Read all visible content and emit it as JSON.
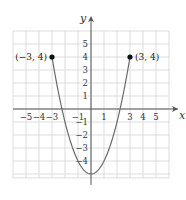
{
  "chart_data": {
    "type": "line",
    "title": "",
    "xlabel": "x",
    "ylabel": "y",
    "xlim": [
      -6,
      6
    ],
    "ylim": [
      -5.4,
      6
    ],
    "grid": true,
    "x_ticks": [
      "-5",
      "-4",
      "-3",
      "-1",
      "1",
      "3",
      "4",
      "5"
    ],
    "x_tick_values": [
      -5,
      -4,
      -3,
      -1,
      1,
      3,
      4,
      5
    ],
    "y_ticks": [
      "5",
      "4",
      "3",
      "2",
      "1",
      "-1",
      "-2",
      "-3",
      "-4"
    ],
    "y_tick_values": [
      5,
      4,
      3,
      2,
      1,
      -1,
      -2,
      -3,
      -4
    ],
    "series": [
      {
        "name": "y = x^2 - 5",
        "domain": [
          -3,
          3
        ],
        "x": [
          -3,
          -2,
          -1,
          0,
          1,
          2,
          3
        ],
        "y": [
          4,
          -1,
          -4,
          -5,
          -4,
          -1,
          4
        ]
      }
    ],
    "annotations": [
      {
        "label": "(−3, 4)",
        "x": -3,
        "y": 4,
        "marker": "filled-dot"
      },
      {
        "label": "(3, 4)",
        "x": 3,
        "y": 4,
        "marker": "filled-dot"
      }
    ]
  }
}
